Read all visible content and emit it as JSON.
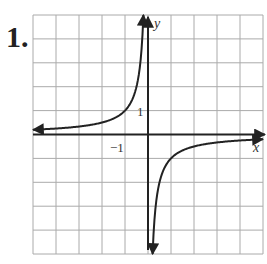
{
  "problem": {
    "number": "1."
  },
  "chart_data": {
    "type": "line",
    "title": "",
    "xlabel": "x",
    "ylabel": "y",
    "xlim": [
      -5,
      5
    ],
    "ylim": [
      -5,
      5
    ],
    "grid": true,
    "tick_labels": {
      "x": [
        "-1"
      ],
      "y": [
        "1"
      ]
    },
    "series": [
      {
        "name": "y = -1/x (left branch)",
        "x": [
          -5,
          -4,
          -3,
          -2,
          -1,
          -0.5,
          -0.25,
          -0.2
        ],
        "y": [
          0.2,
          0.25,
          0.33,
          0.5,
          1,
          2,
          4,
          5
        ]
      },
      {
        "name": "y = -1/x (right branch)",
        "x": [
          0.2,
          0.25,
          0.5,
          1,
          2,
          3,
          4,
          5
        ],
        "y": [
          -5,
          -4,
          -2,
          -1,
          -0.5,
          -0.33,
          -0.25,
          -0.2
        ]
      }
    ],
    "asymptotes": {
      "vertical": 0,
      "horizontal": 0
    }
  },
  "labels": {
    "x_axis": "x",
    "y_axis": "y",
    "x_tick": "−1",
    "y_tick": "1"
  }
}
